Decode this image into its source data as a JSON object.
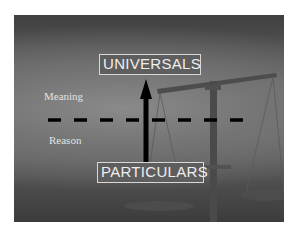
{
  "slide": {
    "top_label": "UNIVERSALS",
    "bottom_label": "PARTICULARS",
    "upper_region_label": "Meaning",
    "lower_region_label": "Reason",
    "divider_style": "dashed",
    "arrow_direction": "up",
    "background_image": "scales-of-justice",
    "colors": {
      "background": "#6a6a6a",
      "label_text": "#eeeeee",
      "label_border": "#d8d8d8",
      "arrow": "#000000",
      "divider": "#000000"
    }
  }
}
